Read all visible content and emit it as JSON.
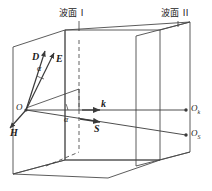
{
  "figure": {
    "caption_labels": {
      "wavefront_1": "波面 I",
      "wavefront_2": "波面 II"
    },
    "colors": {
      "line": "#3a3a3a",
      "plane_edge": "#4a4a4a",
      "text": "#1b1b1b",
      "background": "#ffffff"
    },
    "vectors": [
      {
        "id": "D",
        "label": "D",
        "description": "electric displacement vector, points up-left in wavefront plane"
      },
      {
        "id": "E",
        "label": "E",
        "description": "electric field vector, tilted from D by angle alpha"
      },
      {
        "id": "H",
        "label": "H",
        "description": "magnetic field vector, points down-left out of plane"
      },
      {
        "id": "k",
        "label": "k",
        "description": "wave normal vector, horizontal to the right"
      },
      {
        "id": "S",
        "label": "S",
        "description": "Poynting ray vector, tilted below k by angle alpha"
      }
    ],
    "angles": [
      {
        "id": "alpha-DE",
        "label": "α",
        "between": [
          "D",
          "E"
        ]
      },
      {
        "id": "alpha-kS",
        "label": "α",
        "between": [
          "k",
          "S"
        ]
      }
    ],
    "points": [
      {
        "id": "O",
        "label": "O",
        "sub": "",
        "description": "origin on wavefront I"
      },
      {
        "id": "Ok",
        "label": "O",
        "sub": "k",
        "description": "intersection of k with wavefront II"
      },
      {
        "id": "Os",
        "label": "O",
        "sub": "S",
        "description": "intersection of S with wavefront II"
      }
    ]
  }
}
